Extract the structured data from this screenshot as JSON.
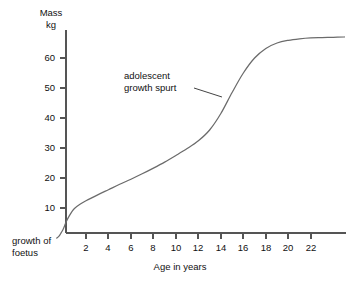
{
  "chart_data": {
    "type": "line",
    "title": "",
    "subtitle": "",
    "xlabel": "Age in years",
    "ylabel": "Mass",
    "ylabel_unit": "kg",
    "xlim": [
      0,
      25
    ],
    "ylim": [
      0,
      70
    ],
    "grid": false,
    "legend": "none",
    "x_ticks": [
      2,
      4,
      6,
      8,
      10,
      12,
      14,
      16,
      18,
      20,
      22
    ],
    "y_ticks": [
      10,
      20,
      30,
      40,
      50,
      60
    ],
    "x_tick_labels": [
      "2",
      "4",
      "6",
      "8",
      "10",
      "12",
      "14",
      "16",
      "18",
      "20",
      "22"
    ],
    "y_tick_labels": [
      "10",
      "20",
      "30",
      "40",
      "50",
      "60"
    ],
    "series": [
      {
        "name": "body mass",
        "x": [
          -0.6,
          -0.4,
          -0.2,
          0,
          0.25,
          0.5,
          0.75,
          1,
          1.5,
          2,
          3,
          4,
          5,
          6,
          7,
          8,
          9,
          10,
          11,
          12,
          13,
          14,
          15,
          16,
          17,
          18,
          19,
          20,
          21,
          22,
          23,
          24,
          25
        ],
        "y": [
          0,
          0.6,
          1.8,
          3.2,
          5.5,
          7.3,
          8.8,
          9.9,
          11.3,
          12.4,
          14.3,
          16.1,
          17.9,
          19.6,
          21.4,
          23.3,
          25.3,
          27.5,
          29.8,
          32.4,
          36.0,
          41.5,
          48.5,
          55.0,
          60.0,
          63.2,
          65.0,
          65.9,
          66.4,
          66.7,
          66.8,
          66.9,
          67.0
        ]
      }
    ],
    "annotations": [
      {
        "text_line1": "adolescent",
        "text_line2": "growth spurt",
        "points_to_x": 14.1,
        "points_to_y": 47.0
      }
    ],
    "axis_notes": [
      {
        "text_line1": "growth of",
        "text_line2": "foetus"
      }
    ]
  },
  "chart": {
    "axis_title_y_line1": "Mass",
    "axis_title_y_line2": "kg",
    "axis_title_x": "Age in years",
    "annotation_line1": "adolescent",
    "annotation_line2": "growth spurt",
    "foetus_line1": "growth of",
    "foetus_line2": "foetus",
    "x_tick_labels": [
      "2",
      "4",
      "6",
      "8",
      "10",
      "12",
      "14",
      "16",
      "18",
      "20",
      "22"
    ],
    "y_tick_labels": [
      "10",
      "20",
      "30",
      "40",
      "50",
      "60"
    ],
    "colors": {
      "background": "#ffffff",
      "axis": "#555555",
      "curve": "#6b6b6b",
      "text": "#111111"
    }
  }
}
